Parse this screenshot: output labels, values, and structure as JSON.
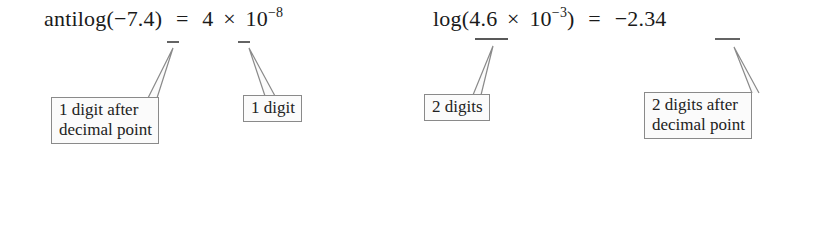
{
  "equations": [
    {
      "id": "antilog",
      "function": "antilog(",
      "argument_prefix": "−7.",
      "argument_marked": "4",
      "close": ")",
      "equals": "=",
      "result_mantissa": "4",
      "times": "×",
      "base": "10",
      "exponent": "−8"
    },
    {
      "id": "log",
      "function": "log(",
      "mantissa": "4.6",
      "times": "×",
      "base": "10",
      "exponent": "−3",
      "close": ")",
      "equals": "=",
      "result_prefix": "−2.",
      "result_marked": "34"
    }
  ],
  "callouts": [
    {
      "id": "callout-1",
      "lines": [
        "1 digit after",
        "decimal point"
      ],
      "points_to": "4 in −7.4"
    },
    {
      "id": "callout-2",
      "lines": [
        "1 digit"
      ],
      "points_to": "4 in 4 × 10⁻⁸"
    },
    {
      "id": "callout-3",
      "lines": [
        "2 digits"
      ],
      "points_to": "4.6"
    },
    {
      "id": "callout-4",
      "lines": [
        "2 digits after",
        "decimal point"
      ],
      "points_to": "34 in −2.34"
    }
  ],
  "colors": {
    "text": "#1a1a1a",
    "box_border": "#8a8a8a",
    "box_fill": "#fbfbfb",
    "underline": "#222222"
  }
}
